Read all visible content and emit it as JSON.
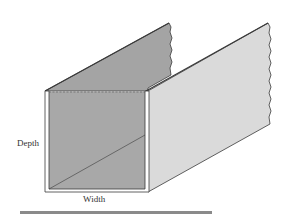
{
  "diagram": {
    "type": "open-channel-illustration",
    "labels": {
      "depth": "Depth",
      "width": "Width"
    },
    "colors": {
      "inner_face": "#a8a8a8",
      "left_wall_outer": "#a4a4a4",
      "right_wall": "#dadada",
      "edge": "#3a3a3a",
      "frame": "#ffffff",
      "bottom_rule": "#8a8a8a",
      "background": "#ffffff"
    }
  }
}
